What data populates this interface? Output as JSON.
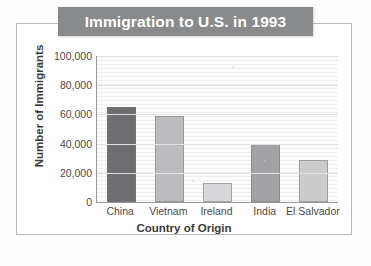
{
  "chart_data": {
    "type": "bar",
    "title": "Immigration to U.S. in 1993",
    "xlabel": "Country of Origin",
    "ylabel": "Number of Immigrants",
    "categories": [
      "China",
      "Vietnam",
      "Ireland",
      "India",
      "El Salvador"
    ],
    "values": [
      65000,
      59000,
      13000,
      40000,
      29000
    ],
    "ylim": [
      0,
      100000
    ],
    "ytick_labels": [
      "0",
      "20,000",
      "40,000",
      "60,000",
      "80,000",
      "100,000"
    ],
    "ytick_values": [
      0,
      20000,
      40000,
      60000,
      80000,
      100000
    ],
    "grid": true,
    "legend": "none",
    "bar_colors": [
      "#6e6e70",
      "#bcbcbe",
      "#d8d8da",
      "#a2a2a4",
      "#cccccd"
    ]
  },
  "figure": {
    "banner_color": "#888a8c",
    "banner_text_color": "#ffffff",
    "frame_color": "#b9b9bb",
    "axis_color": "#9a9a9c",
    "text_color": "#3b3b3d"
  }
}
